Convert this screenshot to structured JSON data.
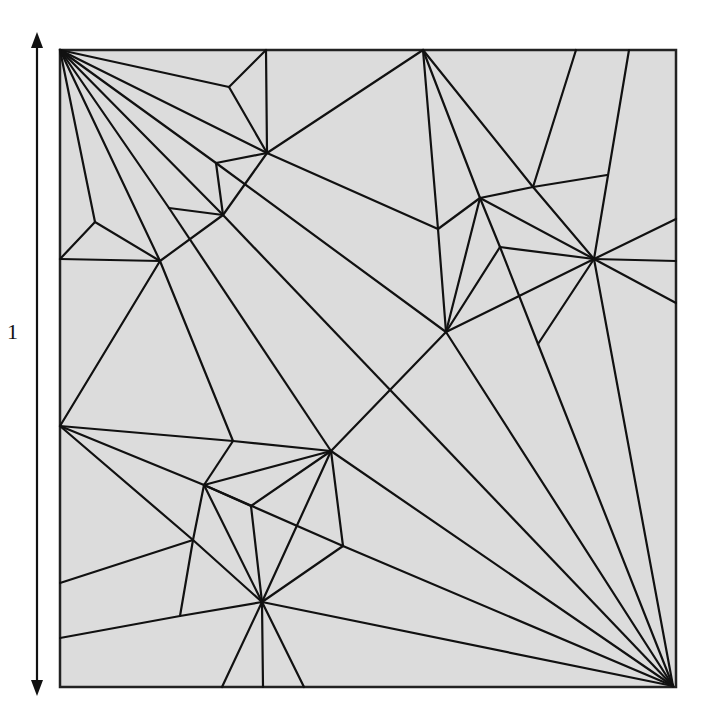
{
  "figure": {
    "dimension_label": "1",
    "colors": {
      "paper": "#dcdcdc",
      "line": "#111111",
      "border": "#222222",
      "background": "#ffffff"
    },
    "square": {
      "x": 60,
      "y": 50,
      "width": 616,
      "height": 637
    },
    "arrow": {
      "x": 37,
      "top": 32,
      "bottom": 696
    },
    "vertices": {
      "TL": [
        60,
        50
      ],
      "BR": [
        673,
        686
      ],
      "T1": [
        266,
        50
      ],
      "T2": [
        423,
        50
      ],
      "T3": [
        576,
        50
      ],
      "T4": [
        629,
        50
      ],
      "L1": [
        60,
        259
      ],
      "L2": [
        60,
        426
      ],
      "L3": [
        60,
        583
      ],
      "L4": [
        60,
        638
      ],
      "R1": [
        676,
        219
      ],
      "R2": [
        676,
        261
      ],
      "R3": [
        676,
        303
      ],
      "B1": [
        222,
        687
      ],
      "B2": [
        263,
        687
      ],
      "B3": [
        304,
        687
      ],
      "a": [
        229,
        87
      ],
      "b": [
        267,
        153
      ],
      "c": [
        216,
        163
      ],
      "d": [
        223,
        215
      ],
      "e": [
        169,
        208
      ],
      "f": [
        160,
        261
      ],
      "g": [
        95,
        222
      ],
      "h": [
        438,
        229
      ],
      "i": [
        480,
        198
      ],
      "j": [
        533,
        187
      ],
      "k": [
        607,
        175
      ],
      "m": [
        594,
        259
      ],
      "n": [
        500,
        247
      ],
      "o": [
        446,
        332
      ],
      "p": [
        538,
        344
      ],
      "q": [
        233,
        441
      ],
      "r": [
        331,
        451
      ],
      "s": [
        204,
        485
      ],
      "t": [
        251,
        506
      ],
      "u": [
        193,
        540
      ],
      "v": [
        343,
        546
      ],
      "w": [
        262,
        602
      ],
      "x": [
        180,
        616
      ]
    },
    "creases": [
      [
        "TL",
        "a"
      ],
      [
        "a",
        "T1"
      ],
      [
        "a",
        "b"
      ],
      [
        "T1",
        "b"
      ],
      [
        "TL",
        "b"
      ],
      [
        "TL",
        "c"
      ],
      [
        "c",
        "b"
      ],
      [
        "c",
        "d"
      ],
      [
        "TL",
        "d"
      ],
      [
        "d",
        "b"
      ],
      [
        "TL",
        "e"
      ],
      [
        "e",
        "d"
      ],
      [
        "TL",
        "f"
      ],
      [
        "f",
        "d"
      ],
      [
        "TL",
        "g"
      ],
      [
        "g",
        "L1"
      ],
      [
        "g",
        "f"
      ],
      [
        "L1",
        "f"
      ],
      [
        "b",
        "T2"
      ],
      [
        "b",
        "h"
      ],
      [
        "T2",
        "h"
      ],
      [
        "T2",
        "i"
      ],
      [
        "T2",
        "j"
      ],
      [
        "j",
        "T3"
      ],
      [
        "j",
        "k"
      ],
      [
        "i",
        "j"
      ],
      [
        "j",
        "m"
      ],
      [
        "T4",
        "m"
      ],
      [
        "i",
        "h"
      ],
      [
        "i",
        "m"
      ],
      [
        "i",
        "n"
      ],
      [
        "n",
        "m"
      ],
      [
        "n",
        "p"
      ],
      [
        "n",
        "o"
      ],
      [
        "i",
        "o"
      ],
      [
        "h",
        "o"
      ],
      [
        "m",
        "o"
      ],
      [
        "m",
        "p"
      ],
      [
        "m",
        "R1"
      ],
      [
        "m",
        "R2"
      ],
      [
        "m",
        "R3"
      ],
      [
        "m",
        "BR"
      ],
      [
        "p",
        "BR"
      ],
      [
        "o",
        "BR"
      ],
      [
        "c",
        "o"
      ],
      [
        "d",
        "BR"
      ],
      [
        "o",
        "r"
      ],
      [
        "f",
        "L2"
      ],
      [
        "f",
        "q"
      ],
      [
        "e",
        "r"
      ],
      [
        "L2",
        "q"
      ],
      [
        "q",
        "r"
      ],
      [
        "q",
        "s"
      ],
      [
        "s",
        "r"
      ],
      [
        "s",
        "t"
      ],
      [
        "t",
        "r"
      ],
      [
        "t",
        "w"
      ],
      [
        "r",
        "w"
      ],
      [
        "r",
        "v"
      ],
      [
        "r",
        "BR"
      ],
      [
        "L2",
        "s"
      ],
      [
        "s",
        "v"
      ],
      [
        "v",
        "BR"
      ],
      [
        "v",
        "w"
      ],
      [
        "L2",
        "u"
      ],
      [
        "u",
        "w"
      ],
      [
        "s",
        "u"
      ],
      [
        "s",
        "w"
      ],
      [
        "u",
        "x"
      ],
      [
        "L3",
        "u"
      ],
      [
        "L4",
        "x"
      ],
      [
        "x",
        "w"
      ],
      [
        "w",
        "B1"
      ],
      [
        "w",
        "B2"
      ],
      [
        "w",
        "B3"
      ],
      [
        "w",
        "BR"
      ]
    ]
  }
}
